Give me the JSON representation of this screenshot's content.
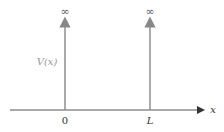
{
  "diagram": {
    "potential_label": "V(x)",
    "x_axis_label": "x",
    "walls": [
      {
        "position_label": "0",
        "height_label": "∞"
      },
      {
        "position_label": "L",
        "height_label": "∞"
      }
    ],
    "colors": {
      "axis": "#333333",
      "wall": "#888888",
      "label_gray": "#999999",
      "text": "#222222"
    }
  }
}
